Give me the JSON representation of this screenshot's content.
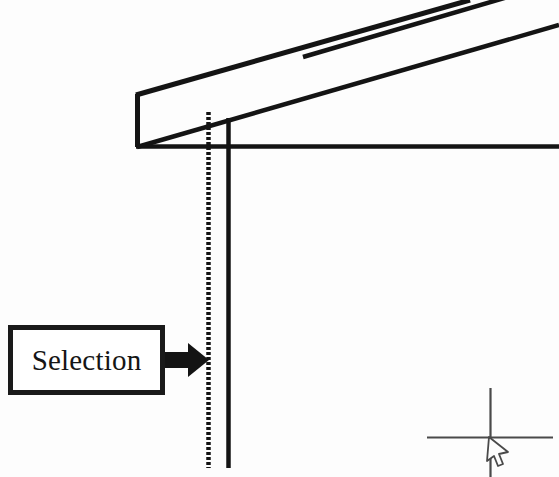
{
  "drawing": {
    "title": "Selection callout on structural CAD elevation",
    "background_color": "#fdfdfd",
    "ink_color": "#151515",
    "cursor_color": "#4a4a4a",
    "callout": {
      "label": "Selection",
      "box": {
        "x": 8,
        "y": 325,
        "width": 157,
        "height": 70,
        "border_width": 5
      },
      "arrow": {
        "name": "block-arrow",
        "direction": "right",
        "from_x": 165,
        "to_x": 207,
        "center_y": 360
      }
    },
    "geometry": {
      "beam": {
        "name": "sloped-roof-beam",
        "description": "Sloped beam in parallel projection rising to the right",
        "top_edge": {
          "x1": 136,
          "y1": 95,
          "x2": 470,
          "y2": 0
        },
        "inner_edge": {
          "x1": 136,
          "y1": 146,
          "x2": 559,
          "y2": 48
        },
        "bottom_edge": {
          "x1": 136,
          "y1": 146,
          "x2": 559,
          "y2": 22
        },
        "left_end": {
          "x1": 136,
          "y1": 95,
          "x2": 136,
          "y2": 146
        }
      },
      "horizontal_member": {
        "name": "horizontal-reference-line",
        "x1": 136,
        "y1": 146,
        "x2": 559,
        "y2": 146
      },
      "column_dashed": {
        "name": "selected-hidden-edge",
        "x": 208,
        "y1": 112,
        "y2": 468,
        "dash": "3 2",
        "selected": true
      },
      "column_solid": {
        "name": "column-face-edge",
        "x": 228,
        "y1": 118,
        "y2": 468
      }
    },
    "cursor": {
      "name": "crosshair-pick-cursor",
      "center_x": 490,
      "center_y": 437,
      "h_x1": 427,
      "h_x2": 553,
      "v_y1": 388,
      "v_y2": 477,
      "pointer_tip_x": 490,
      "pointer_tip_y": 437
    }
  }
}
